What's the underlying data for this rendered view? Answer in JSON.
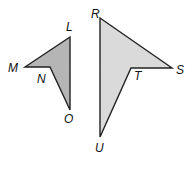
{
  "diagram": {
    "type": "congruent-figures",
    "figures": [
      {
        "name": "LMNO",
        "fill": "#b5b5b5",
        "stroke": "#222222",
        "points": "70,37 25,67 50,67 70,110",
        "vertices": {
          "L": {
            "label": "L",
            "x": 66,
            "y": 31
          },
          "M": {
            "label": "M",
            "x": 8,
            "y": 72
          },
          "N": {
            "label": "N",
            "x": 37,
            "y": 83
          },
          "O": {
            "label": "O",
            "x": 64,
            "y": 123
          }
        }
      },
      {
        "name": "RSTU",
        "fill": "#dadada",
        "stroke": "#222222",
        "points": "100,18 172,68 131,68 100,137",
        "vertices": {
          "R": {
            "label": "R",
            "x": 91,
            "y": 18
          },
          "S": {
            "label": "S",
            "x": 176,
            "y": 74
          },
          "T": {
            "label": "T",
            "x": 134,
            "y": 80
          },
          "U": {
            "label": "U",
            "x": 95,
            "y": 152
          }
        }
      }
    ]
  }
}
